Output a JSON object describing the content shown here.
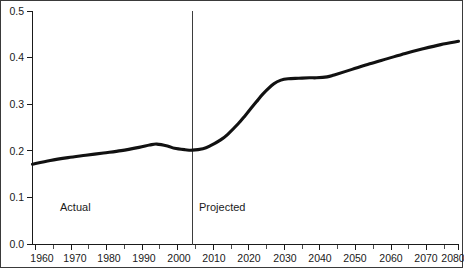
{
  "chart_data": {
    "type": "line",
    "title": "",
    "subtitle": "",
    "xlabel": "",
    "ylabel": "",
    "xlim": [
      1960,
      2080
    ],
    "ylim": [
      0.0,
      0.5
    ],
    "grid": false,
    "legend_position": "none",
    "x_tick_labels": [
      "1960",
      "1970",
      "1980",
      "1990",
      "2000",
      "2010",
      "2020",
      "2030",
      "2040",
      "2050",
      "2060",
      "2070",
      "2080"
    ],
    "x_ticks": [
      1960,
      1970,
      1980,
      1990,
      2000,
      2010,
      2020,
      2030,
      2040,
      2050,
      2060,
      2070,
      2080
    ],
    "x_minor_ticks": [
      1965,
      1975,
      1985,
      1995,
      2005,
      2015,
      2025,
      2035,
      2045,
      2055,
      2065,
      2075
    ],
    "y_tick_labels": [
      "0.0",
      "0.1",
      "0.2",
      "0.3",
      "0.4",
      "0.5"
    ],
    "y_ticks": [
      0.0,
      0.1,
      0.2,
      0.3,
      0.4,
      0.5
    ],
    "series": [
      {
        "name": "ratio",
        "color": "#111111",
        "x": [
          1960,
          1965,
          1970,
          1975,
          1980,
          1985,
          1990,
          1993,
          1995,
          1998,
          2000,
          2003,
          2005,
          2008,
          2010,
          2013,
          2015,
          2018,
          2020,
          2023,
          2025,
          2028,
          2030,
          2032,
          2035,
          2038,
          2040,
          2043,
          2045,
          2050,
          2055,
          2060,
          2065,
          2070,
          2075,
          2080
        ],
        "values": [
          0.172,
          0.18,
          0.186,
          0.191,
          0.196,
          0.201,
          0.208,
          0.213,
          0.215,
          0.211,
          0.206,
          0.203,
          0.202,
          0.205,
          0.211,
          0.224,
          0.236,
          0.259,
          0.277,
          0.305,
          0.323,
          0.344,
          0.352,
          0.355,
          0.356,
          0.357,
          0.357,
          0.359,
          0.363,
          0.375,
          0.387,
          0.398,
          0.409,
          0.419,
          0.428,
          0.435
        ]
      }
    ],
    "annotations": [
      {
        "name": "divider",
        "type": "vline",
        "x": 2005
      },
      {
        "name": "actual-label",
        "type": "text",
        "text": "Actual",
        "x": 1968,
        "y": 0.063
      },
      {
        "name": "projected-label",
        "type": "text",
        "text": "Projected",
        "x": 2008,
        "y": 0.063
      }
    ]
  },
  "labels": {
    "actual": "Actual",
    "projected": "Projected"
  },
  "axes": {
    "y": {
      "t0": "0.0",
      "t1": "0.1",
      "t2": "0.2",
      "t3": "0.3",
      "t4": "0.4",
      "t5": "0.5"
    },
    "x": {
      "t0": "1960",
      "t1": "1970",
      "t2": "1980",
      "t3": "1990",
      "t4": "2000",
      "t5": "2010",
      "t6": "2020",
      "t7": "2030",
      "t8": "2040",
      "t9": "2050",
      "t10": "2060",
      "t11": "2070",
      "t12": "2080"
    }
  },
  "colors": {
    "series": "#111111",
    "axis": "#1a1a1a",
    "divider": "#3d3d3d",
    "frame": "#3a3a3a",
    "background": "#ffffff"
  }
}
